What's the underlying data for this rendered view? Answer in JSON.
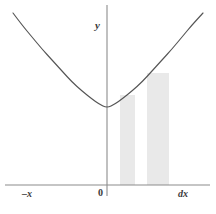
{
  "figure": {
    "title": "",
    "background_color": "#ffffff",
    "width": 216,
    "height": 214
  },
  "labels": {
    "y_axis": "y",
    "origin": "0",
    "x_axis_left": "–x",
    "x_axis_right": "dx"
  },
  "colors": {
    "curve": "#555555",
    "axis": "#8c8c8c",
    "rectangle_fill": "#e9e9e9",
    "label_text": "#3a3a3a",
    "background": "#ffffff"
  },
  "chart_data": {
    "type": "line",
    "title": "",
    "xlabel": "",
    "ylabel": "",
    "subtitle": "",
    "grid": false,
    "legend": null,
    "axes": {
      "x_axis_y_pixel": 185,
      "y_axis_x_pixel": 107,
      "x_axis_extent_px": [
        5,
        210
      ],
      "y_axis_extent_px": [
        5,
        196
      ],
      "xlim": [
        -1.0,
        1.0
      ],
      "ylim": [
        0,
        1.0
      ],
      "x_tick_labels": [
        "–x",
        "0",
        "dx"
      ],
      "y_tick_labels": []
    },
    "series": [
      {
        "name": "parabola",
        "kind": "curve",
        "equation": "y = a*x^2 + c",
        "vertex_px": [
          107,
          108
        ],
        "points_px": [
          [
            13,
            13
          ],
          [
            22,
            25
          ],
          [
            32,
            37
          ],
          [
            42,
            49
          ],
          [
            52,
            60
          ],
          [
            62,
            71
          ],
          [
            72,
            82
          ],
          [
            82,
            91
          ],
          [
            92,
            99
          ],
          [
            99,
            104
          ],
          [
            107,
            108
          ],
          [
            115,
            104
          ],
          [
            122,
            99
          ],
          [
            132,
            91
          ],
          [
            142,
            82
          ],
          [
            152,
            71
          ],
          [
            162,
            60
          ],
          [
            172,
            49
          ],
          [
            182,
            37
          ],
          [
            192,
            25
          ],
          [
            203,
            13
          ]
        ]
      }
    ],
    "annotations": [
      {
        "kind": "rectangle",
        "name": "riemann-rect-1",
        "x_px": 120,
        "y_px": 95,
        "width_px": 15,
        "height_px": 90,
        "fill": "#e9e9e9"
      },
      {
        "kind": "rectangle",
        "name": "riemann-rect-2",
        "x_px": 147,
        "y_px": 73,
        "width_px": 22,
        "height_px": 112,
        "fill": "#e9e9e9"
      }
    ]
  }
}
